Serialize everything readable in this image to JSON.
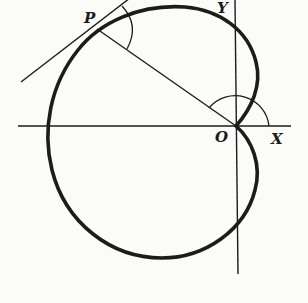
{
  "diagram": {
    "type": "polar curve (cardioid) with tangent",
    "labels": {
      "point": "P",
      "origin": "O",
      "x_axis": "X",
      "y_axis": "Y"
    },
    "elements": [
      "x-axis",
      "y-axis",
      "cardioid curve with cusp at O",
      "radius vector OP",
      "tangent line at P",
      "angle arc between radius vector and tangent at P",
      "angle arc at O from X axis to OP"
    ],
    "colors": {
      "ink": "#1c1c1c",
      "paper": "#fbfbf8"
    }
  }
}
